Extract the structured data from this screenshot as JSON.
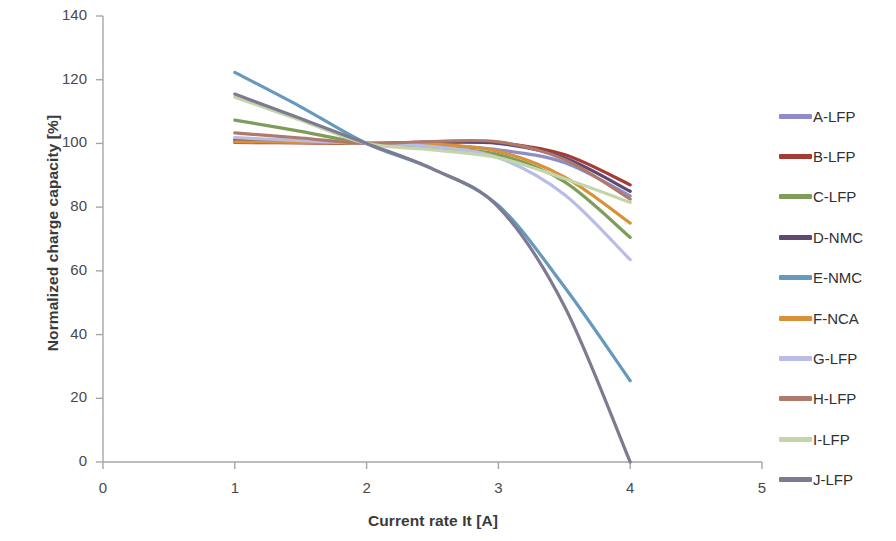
{
  "chart_data": {
    "type": "line",
    "title": "",
    "xlabel": "Current rate It [A]",
    "ylabel": "Normalized charge capacity [%]",
    "xlim": [
      0,
      5
    ],
    "ylim": [
      0,
      140
    ],
    "xticks": [
      0,
      1,
      2,
      3,
      4,
      5
    ],
    "yticks": [
      0,
      20,
      40,
      60,
      80,
      100,
      120,
      140
    ],
    "grid": false,
    "legend_position": "right",
    "x": [
      1,
      1.5,
      2,
      2.5,
      3,
      3.5,
      4
    ],
    "series": [
      {
        "name": "A-LFP",
        "color": "#8e8ccb",
        "values": [
          101.5,
          100.8,
          100.0,
          99.5,
          98.0,
          94.0,
          83.5
        ]
      },
      {
        "name": "B-LFP",
        "color": "#a63b34",
        "values": [
          100.3,
          100.2,
          100.0,
          100.3,
          100.2,
          96.5,
          87.0
        ]
      },
      {
        "name": "C-LFP",
        "color": "#7e9c5a",
        "values": [
          107.3,
          103.8,
          100.0,
          98.5,
          96.5,
          88.0,
          70.5
        ]
      },
      {
        "name": "D-NMC",
        "color": "#5e4a6e",
        "values": [
          101.0,
          100.6,
          100.0,
          100.4,
          100.0,
          95.5,
          85.0
        ]
      },
      {
        "name": "E-NMC",
        "color": "#6699bb",
        "values": [
          122.3,
          111.5,
          100.0,
          92.0,
          80.5,
          55.0,
          25.5
        ]
      },
      {
        "name": "F-NCA",
        "color": "#d99039",
        "values": [
          100.5,
          100.3,
          100.0,
          99.8,
          97.5,
          89.5,
          75.0
        ]
      },
      {
        "name": "G-LFP",
        "color": "#b9bce4",
        "values": [
          101.8,
          100.9,
          100.0,
          99.0,
          95.5,
          84.0,
          63.5
        ]
      },
      {
        "name": "H-LFP",
        "color": "#b07a6a",
        "values": [
          103.3,
          101.7,
          100.0,
          100.6,
          100.5,
          95.0,
          82.5
        ]
      },
      {
        "name": "I-LFP",
        "color": "#c3d6a9",
        "values": [
          114.5,
          107.3,
          100.0,
          98.0,
          95.5,
          89.0,
          81.5
        ]
      },
      {
        "name": "J-LFP",
        "color": "#7d7a92",
        "values": [
          115.5,
          107.8,
          100.0,
          92.0,
          80.0,
          49.0,
          0.0
        ]
      }
    ]
  },
  "axes": {
    "x_title": "Current rate It [A]",
    "y_title": "Normalized charge capacity [%]",
    "x_tick_labels": [
      "0",
      "1",
      "2",
      "3",
      "4",
      "5"
    ],
    "y_tick_labels": [
      "0",
      "20",
      "40",
      "60",
      "80",
      "100",
      "120",
      "140"
    ]
  },
  "legend": {
    "entries": [
      {
        "label": "A-LFP",
        "color": "#8e8ccb"
      },
      {
        "label": "B-LFP",
        "color": "#a63b34"
      },
      {
        "label": "C-LFP",
        "color": "#7e9c5a"
      },
      {
        "label": "D-NMC",
        "color": "#5e4a6e"
      },
      {
        "label": "E-NMC",
        "color": "#6699bb"
      },
      {
        "label": "F-NCA",
        "color": "#d99039"
      },
      {
        "label": "G-LFP",
        "color": "#b9bce4"
      },
      {
        "label": "H-LFP",
        "color": "#b07a6a"
      },
      {
        "label": "I-LFP",
        "color": "#c3d6a9"
      },
      {
        "label": "J-LFP",
        "color": "#7d7a92"
      }
    ]
  },
  "style": {
    "axis_color": "#a6a6a6",
    "text_color": "#404040",
    "background": "#ffffff"
  }
}
